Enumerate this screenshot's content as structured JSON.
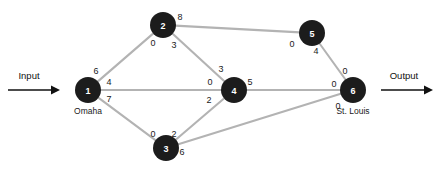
{
  "figure": {
    "input_label": "Input",
    "output_label": "Output",
    "caption": ""
  },
  "colors": {
    "node_fill": "#1c1c1c",
    "node_text": "#ffffff",
    "edge": "#b3b3b3",
    "label_text": "#1a1a1a",
    "arrow": "#111111",
    "background": "#ffffff"
  },
  "chart_data": {
    "type": "diagram",
    "subtype": "network-flow-graph",
    "title": "",
    "nodes": [
      {
        "id": "1",
        "label": "1",
        "city": "Omaha",
        "x": 88,
        "y": 90,
        "r": 13
      },
      {
        "id": "2",
        "label": "2",
        "city": "",
        "x": 163,
        "y": 25,
        "r": 13
      },
      {
        "id": "3",
        "label": "3",
        "city": "",
        "x": 166,
        "y": 148,
        "r": 13
      },
      {
        "id": "4",
        "label": "4",
        "city": "",
        "x": 234,
        "y": 90,
        "r": 13
      },
      {
        "id": "5",
        "label": "5",
        "city": "",
        "x": 312,
        "y": 33,
        "r": 13
      },
      {
        "id": "6",
        "label": "6",
        "city": "St. Louis",
        "x": 353,
        "y": 90,
        "r": 13
      }
    ],
    "edges": [
      {
        "from": "1",
        "to": "2",
        "from_value": "6",
        "to_value": "0",
        "from_label_x": 96,
        "from_label_y": 71,
        "to_label_x": 153,
        "to_label_y": 43
      },
      {
        "from": "1",
        "to": "4",
        "from_value": "4",
        "to_value": "0",
        "from_label_x": 109,
        "from_label_y": 82,
        "to_label_x": 210,
        "to_label_y": 82
      },
      {
        "from": "1",
        "to": "3",
        "from_value": "7",
        "to_value": "0",
        "from_label_x": 109,
        "from_label_y": 99,
        "to_label_x": 153,
        "to_label_y": 134
      },
      {
        "from": "2",
        "to": "4",
        "from_value": "3",
        "to_value": "3",
        "from_label_x": 174,
        "from_label_y": 45,
        "to_label_x": 221,
        "to_label_y": 69
      },
      {
        "from": "2",
        "to": "5",
        "from_value": "8",
        "to_value": "0",
        "from_label_x": 180,
        "from_label_y": 17,
        "to_label_x": 292,
        "to_label_y": 44
      },
      {
        "from": "3",
        "to": "4",
        "from_value": "2",
        "to_value": "2",
        "from_label_x": 174,
        "from_label_y": 134,
        "to_label_x": 209,
        "to_label_y": 100
      },
      {
        "from": "3",
        "to": "6",
        "from_value": "6",
        "to_value": "0",
        "from_label_x": 182,
        "from_label_y": 152,
        "to_label_x": 338,
        "to_label_y": 106
      },
      {
        "from": "4",
        "to": "6",
        "from_value": "5",
        "to_value": "0",
        "from_label_x": 250,
        "from_label_y": 82,
        "to_label_x": 334,
        "to_label_y": 84
      },
      {
        "from": "5",
        "to": "6",
        "from_value": "4",
        "to_value": "0",
        "from_label_x": 316,
        "from_label_y": 51,
        "to_label_x": 345,
        "to_label_y": 71
      }
    ],
    "input_arrow": {
      "label": "Input",
      "label_x": 29,
      "label_y": 75,
      "x1": 8,
      "y1": 90,
      "x2": 60,
      "y2": 90
    },
    "output_arrow": {
      "label": "Output",
      "label_x": 404,
      "label_y": 75,
      "x1": 381,
      "y1": 90,
      "x2": 433,
      "y2": 90
    }
  }
}
